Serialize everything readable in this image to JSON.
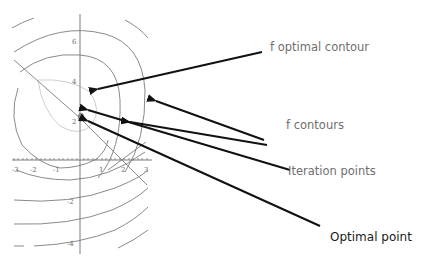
{
  "diagram": {
    "type": "annotated contour plot",
    "axes": {
      "x_ticks": [
        "-3",
        "-2",
        "-1",
        "1",
        "2",
        "3"
      ],
      "y_ticks": [
        "6",
        "4",
        "2",
        "-2",
        "-4"
      ]
    },
    "colors": {
      "contour": "#8a8a8a",
      "optimal_contour": "#cfcfcf",
      "axis": "#7a7a7a",
      "arrow": "#111111",
      "grey_label": "#6f6f6f",
      "black_label": "#1a1a1a",
      "optimal_point": "#808080"
    },
    "annotations": [
      {
        "id": "optimal-contour",
        "label": "f  optimal contour"
      },
      {
        "id": "contours",
        "label": "f contours"
      },
      {
        "id": "iteration-points",
        "label": "Iteration points"
      },
      {
        "id": "optimal-point",
        "label": "Optimal point"
      }
    ]
  }
}
